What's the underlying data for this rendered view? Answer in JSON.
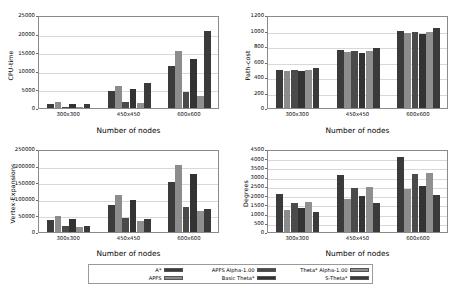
{
  "figure": {
    "background": "#ffffff",
    "categories": [
      "300x300",
      "450x450",
      "600x600"
    ],
    "xlabel": "Number of nodes"
  },
  "series_names": [
    "A*",
    "APFS",
    "APFS Alpha-1.00",
    "Basic Theta*",
    "Theta* Alpha-1.00",
    "S-Theta*"
  ],
  "series_colors": [
    "#3b3b3b",
    "#8c8c8c",
    "#4a4a4a",
    "#333333",
    "#8f8f8f",
    "#3a3a3a"
  ],
  "legend": {
    "position": "bottom-center",
    "entries": [
      {
        "label": "A*",
        "color": "#3b3b3b"
      },
      {
        "label": "APFS",
        "color": "#8c8c8c"
      },
      {
        "label": "APFS Alpha-1.00",
        "color": "#4a4a4a"
      },
      {
        "label": "Basic Theta*",
        "color": "#333333"
      },
      {
        "label": "Theta* Alpha-1.00",
        "color": "#8f8f8f"
      },
      {
        "label": "S-Theta*",
        "color": "#3a3a3a"
      }
    ]
  },
  "chart_data": [
    {
      "id": "cpu-time",
      "type": "bar",
      "title": "",
      "xlabel": "Number of nodes",
      "ylabel": "CPU-time",
      "categories": [
        "300x300",
        "450x450",
        "600x600"
      ],
      "ylim": [
        0,
        25000
      ],
      "yticks": [
        0,
        5000,
        10000,
        15000,
        20000,
        25000
      ],
      "ytick_labels": [
        "0",
        "5000",
        "10000",
        "15000",
        "20000",
        "25000"
      ],
      "grid": true,
      "legend_position": "figure-bottom",
      "series": [
        {
          "name": "A*",
          "values": [
            1100,
            4500,
            11400
          ]
        },
        {
          "name": "APFS",
          "values": [
            1700,
            5900,
            15400
          ]
        },
        {
          "name": "APFS Alpha-1.00",
          "values": [
            300,
            1700,
            4400
          ]
        },
        {
          "name": "Basic Theta*",
          "values": [
            1200,
            5000,
            13100
          ]
        },
        {
          "name": "Theta* Alpha-1.00",
          "values": [
            350,
            1250,
            3200
          ]
        },
        {
          "name": "S-Theta*",
          "values": [
            1150,
            6600,
            20800
          ]
        }
      ]
    },
    {
      "id": "path-cost",
      "type": "bar",
      "title": "",
      "xlabel": "Number of nodes",
      "ylabel": "Path-cost",
      "categories": [
        "300x300",
        "450x450",
        "600x600"
      ],
      "ylim": [
        0,
        1200
      ],
      "yticks": [
        0,
        200,
        400,
        600,
        800,
        1000,
        1200
      ],
      "ytick_labels": [
        "0",
        "200",
        "400",
        "600",
        "800",
        "1000",
        "1200"
      ],
      "grid": true,
      "legend_position": "figure-bottom",
      "series": [
        {
          "name": "A*",
          "values": [
            495,
            745,
            990
          ]
        },
        {
          "name": "APFS",
          "values": [
            478,
            725,
            962
          ]
        },
        {
          "name": "APFS Alpha-1.00",
          "values": [
            485,
            730,
            978
          ]
        },
        {
          "name": "Basic Theta*",
          "values": [
            472,
            715,
            952
          ]
        },
        {
          "name": "Theta* Alpha-1.00",
          "values": [
            485,
            730,
            975
          ]
        },
        {
          "name": "S-Theta*",
          "values": [
            512,
            772,
            1030
          ]
        }
      ]
    },
    {
      "id": "vertex-expansions",
      "type": "bar",
      "title": "",
      "xlabel": "Number of nodes",
      "ylabel": "Vertex-Expansions",
      "categories": [
        "300x300",
        "450x450",
        "600x600"
      ],
      "ylim": [
        0,
        250000
      ],
      "yticks": [
        0,
        50000,
        100000,
        150000,
        200000,
        250000
      ],
      "ytick_labels": [
        "0",
        "50000",
        "100000",
        "150000",
        "200000",
        "250000"
      ],
      "grid": true,
      "legend_position": "figure-bottom",
      "series": [
        {
          "name": "A*",
          "values": [
            36000,
            82000,
            150000
          ]
        },
        {
          "name": "APFS",
          "values": [
            48000,
            111000,
            203000
          ]
        },
        {
          "name": "APFS Alpha-1.00",
          "values": [
            19000,
            43000,
            75000
          ]
        },
        {
          "name": "Basic Theta*",
          "values": [
            40000,
            95000,
            176000
          ]
        },
        {
          "name": "Theta* Alpha-1.00",
          "values": [
            16000,
            34000,
            62000
          ]
        },
        {
          "name": "S-Theta*",
          "values": [
            17000,
            40000,
            68000
          ]
        }
      ]
    },
    {
      "id": "degrees",
      "type": "bar",
      "title": "",
      "xlabel": "Number of nodes",
      "ylabel": "Degrees",
      "categories": [
        "300x300",
        "450x450",
        "600x600"
      ],
      "ylim": [
        0,
        4500
      ],
      "yticks": [
        0,
        500,
        1000,
        1500,
        2000,
        2500,
        3000,
        3500,
        4000,
        4500
      ],
      "ytick_labels": [
        "0",
        "500",
        "1000",
        "1500",
        "2000",
        "2500",
        "3000",
        "3500",
        "4000",
        "4500"
      ],
      "grid": true,
      "legend_position": "figure-bottom",
      "series": [
        {
          "name": "A*",
          "values": [
            2070,
            3080,
            4060
          ]
        },
        {
          "name": "APFS",
          "values": [
            1200,
            1780,
            2330
          ]
        },
        {
          "name": "APFS Alpha-1.00",
          "values": [
            1600,
            2400,
            3130
          ]
        },
        {
          "name": "Basic Theta*",
          "values": [
            1290,
            1930,
            2520
          ]
        },
        {
          "name": "Theta* Alpha-1.00",
          "values": [
            1610,
            2430,
            3180
          ]
        },
        {
          "name": "S-Theta*",
          "values": [
            1090,
            1560,
            2010
          ]
        }
      ]
    }
  ]
}
